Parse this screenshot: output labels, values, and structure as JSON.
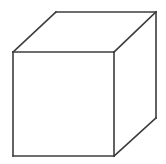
{
  "image": {
    "title": "Cube",
    "subject": "wireframe-cube",
    "width": 166,
    "height": 164,
    "background_color": "#ffffff"
  },
  "figure": {
    "name": "cube",
    "stroke_color": "#3c3c3c",
    "fill_color": "#ffffff",
    "stroke_width": 1.6,
    "vertices": {
      "front_top_left": [
        13,
        52
      ],
      "front_top_right": [
        114,
        52
      ],
      "front_bottom_right": [
        114,
        156
      ],
      "front_bottom_left": [
        13,
        156
      ],
      "back_top_left": [
        56,
        12
      ],
      "back_top_right": [
        156,
        12
      ],
      "back_bottom_right": [
        156,
        118
      ]
    },
    "faces": [
      {
        "name": "front-face",
        "points": "13,52 114,52 114,156 13,156"
      },
      {
        "name": "top-face",
        "points": "13,52 56,12 156,12 114,52"
      },
      {
        "name": "right-face",
        "points": "114,52 156,12 156,118 114,156"
      }
    ],
    "edges": [
      {
        "name": "front-top-edge",
        "points": "13,52 114,52"
      },
      {
        "name": "front-right-edge",
        "points": "114,52 114,156"
      },
      {
        "name": "front-bottom-edge",
        "points": "114,156 13,156"
      },
      {
        "name": "front-left-edge",
        "points": "13,156 13,52"
      },
      {
        "name": "top-left-diagonal-edge",
        "points": "13,52 56,12"
      },
      {
        "name": "top-back-edge",
        "points": "56,12 156,12"
      },
      {
        "name": "top-right-diagonal-edge",
        "points": "156,12 114,52"
      },
      {
        "name": "right-back-vertical-edge",
        "points": "156,12 156,118"
      },
      {
        "name": "bottom-right-diagonal-edge",
        "points": "156,118 114,156"
      }
    ]
  }
}
